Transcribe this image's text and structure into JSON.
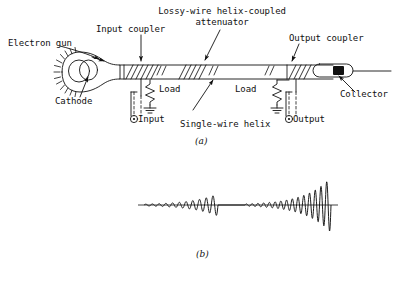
{
  "figure": {
    "title_a": "(a)",
    "title_b": "(b)",
    "labels": {
      "electron_gun": "Electron gun",
      "cathode": "Cathode",
      "input_coupler": "Input coupler",
      "input": "Input",
      "load_left": "Load",
      "attenuator_line1": "Lossy-wire helix-coupled",
      "attenuator_line2": "attenuator",
      "single_wire_helix": "Single-wire helix",
      "output_coupler": "Output coupler",
      "load_right": "Load",
      "output": "Output",
      "collector": "Collector"
    },
    "colors": {
      "ink": "#111111",
      "background": "#ffffff"
    }
  },
  "chart_data": {
    "type": "line",
    "title": "(b)",
    "xlabel": "",
    "ylabel": "",
    "grid": false,
    "legend": null,
    "axis_baseline_y": 0,
    "xlim": [
      0,
      200
    ],
    "ylim": [
      -60,
      60
    ],
    "series": [
      {
        "name": "first-growing-wave",
        "x_start": 6,
        "x_end": 80,
        "envelope_start": 1.5,
        "envelope_end": 22,
        "cycles": 11,
        "note": "grows exponentially then is cut off by attenuator"
      },
      {
        "name": "attenuator-gap",
        "x_start": 80,
        "x_end": 107,
        "envelope_start": 0,
        "envelope_end": 0,
        "cycles": 0,
        "note": "flat baseline through lossy-wire attenuator"
      },
      {
        "name": "second-growing-wave",
        "x_start": 107,
        "x_end": 193,
        "envelope_start": 2,
        "envelope_end": 55,
        "cycles": 15,
        "note": "regrows to full output amplitude at collector end"
      }
    ]
  }
}
